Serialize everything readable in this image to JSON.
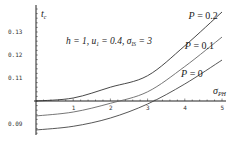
{
  "chart_data": {
    "type": "line",
    "title": "",
    "xlabel": "σ_PH",
    "ylabel": "t_c",
    "annotation": "h = 1, u₁ = 0.4, σ_IS = 3",
    "xlim": [
      0,
      5
    ],
    "ylim": [
      0.085,
      0.14
    ],
    "x_axis_crosses_y_at": 0.1,
    "x_ticks": [
      1,
      2,
      3,
      4,
      5
    ],
    "y_ticks": [
      0.09,
      0.11,
      0.12,
      0.13
    ],
    "y_tick_labels": [
      "0.09",
      "0.11",
      "0.12",
      "0.13"
    ],
    "grid": false,
    "legend": "inline labels",
    "x": [
      0,
      1,
      2,
      3,
      4,
      5
    ],
    "series": [
      {
        "name": "P = 0.2",
        "label_pos": [
          4.1,
          0.1355
        ],
        "values": [
          0.1,
          0.1013,
          0.106,
          0.111,
          0.124,
          0.1387
        ]
      },
      {
        "name": "P = 0.1",
        "label_pos": [
          4.0,
          0.1225
        ],
        "values": [
          0.0935,
          0.0952,
          0.099,
          0.104,
          0.115,
          0.1278
        ]
      },
      {
        "name": "P = 0",
        "label_pos": [
          3.9,
          0.1105
        ],
        "values": [
          0.0874,
          0.089,
          0.0926,
          0.0987,
          0.1074,
          0.1178
        ]
      }
    ]
  },
  "labels": {
    "y_axis": "t",
    "y_axis_sub": "c",
    "x_axis": "σ",
    "x_axis_sub": "PH",
    "annotation_main": "h = 1, u",
    "annotation_sub1": "1",
    "annotation_mid": " = 0.4, σ",
    "annotation_sub2": "IS",
    "annotation_end": " = 3"
  }
}
